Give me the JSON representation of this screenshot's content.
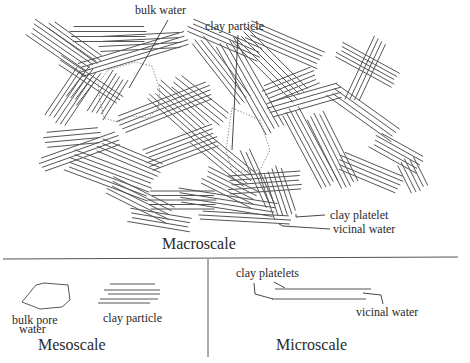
{
  "labels": {
    "bulk_water": "bulk water",
    "clay_particle_macro": "clay particle",
    "clay_platelet": "clay platelet",
    "vicinal_water_macro": "vicinal water",
    "macroscale": "Macroscale",
    "bulk_pore_line1": "bulk pore",
    "bulk_pore_line2": "water",
    "clay_particle_meso": "clay particle",
    "mesoscale": "Mesoscale",
    "clay_platelets": "clay platelets",
    "vicinal_water_micro": "vicinal water",
    "microscale": "Microscale"
  },
  "panels": [
    {
      "name": "macroscale",
      "content": "random assembly of clay particles with bulk water pores"
    },
    {
      "name": "mesoscale",
      "content": "bulk pore water and a single clay particle"
    },
    {
      "name": "microscale",
      "content": "two clay platelets separated by vicinal water"
    }
  ]
}
